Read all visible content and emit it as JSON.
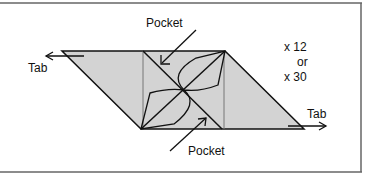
{
  "diagram": {
    "labels": {
      "pocket_top": "Pocket",
      "pocket_bottom": "Pocket",
      "tab_left": "Tab",
      "tab_right": "Tab",
      "count_line1": "x 12",
      "count_line2": "or",
      "count_line3": "x 30"
    },
    "colors": {
      "fill": "#d3d3d3",
      "stroke": "#111111",
      "frame": "#555555"
    }
  }
}
